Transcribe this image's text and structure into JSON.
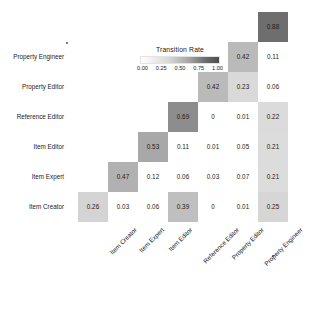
{
  "chart_data": {
    "type": "heatmap",
    "title": "",
    "legend_title": "Transition Rate",
    "legend_ticks": [
      "0.00",
      "0.25",
      "0.50",
      "0.75",
      "1.00"
    ],
    "legend_position": "inside-upper-left",
    "colorscale": "grayscale-white-to-dark",
    "zlim": [
      0,
      1
    ],
    "xlabel": "",
    "ylabel": "",
    "grid": false,
    "x_categories": [
      "Item Creator",
      "Item Expert",
      "Item Editor",
      "Reference Editor",
      "Property Editor",
      "Property Engineer"
    ],
    "y_categories": [
      "Property Engineer",
      "Property Editor",
      "Reference Editor",
      "Item Editor",
      "Item Expert",
      "Item Creator"
    ],
    "n_columns": 7,
    "n_rows": 7,
    "cells": [
      {
        "row": 0,
        "col": 6,
        "value": "0.88",
        "v": 0.88,
        "shaded": true
      },
      {
        "row": 1,
        "col": 5,
        "value": "0.42",
        "v": 0.42,
        "shaded": true
      },
      {
        "row": 1,
        "col": 6,
        "value": "0.11",
        "v": 0.11,
        "shaded": false
      },
      {
        "row": 2,
        "col": 4,
        "value": "0.42",
        "v": 0.42,
        "shaded": true
      },
      {
        "row": 2,
        "col": 5,
        "value": "0.23",
        "v": 0.23,
        "shaded": true
      },
      {
        "row": 2,
        "col": 6,
        "value": "0.06",
        "v": 0.06,
        "shaded": false
      },
      {
        "row": 3,
        "col": 3,
        "value": "0.69",
        "v": 0.69,
        "shaded": true
      },
      {
        "row": 3,
        "col": 4,
        "value": "0",
        "v": 0,
        "shaded": false
      },
      {
        "row": 3,
        "col": 5,
        "value": "0.01",
        "v": 0.01,
        "shaded": false
      },
      {
        "row": 3,
        "col": 6,
        "value": "0.22",
        "v": 0.22,
        "shaded": true
      },
      {
        "row": 4,
        "col": 2,
        "value": "0.53",
        "v": 0.53,
        "shaded": true
      },
      {
        "row": 4,
        "col": 3,
        "value": "0.11",
        "v": 0.11,
        "shaded": false
      },
      {
        "row": 4,
        "col": 4,
        "value": "0.01",
        "v": 0.01,
        "shaded": false
      },
      {
        "row": 4,
        "col": 5,
        "value": "0.05",
        "v": 0.05,
        "shaded": false
      },
      {
        "row": 4,
        "col": 6,
        "value": "0.21",
        "v": 0.21,
        "shaded": true
      },
      {
        "row": 5,
        "col": 1,
        "value": "0.47",
        "v": 0.47,
        "shaded": true
      },
      {
        "row": 5,
        "col": 2,
        "value": "0.12",
        "v": 0.12,
        "shaded": false
      },
      {
        "row": 5,
        "col": 3,
        "value": "0.06",
        "v": 0.06,
        "shaded": false
      },
      {
        "row": 5,
        "col": 4,
        "value": "0.03",
        "v": 0.03,
        "shaded": false
      },
      {
        "row": 5,
        "col": 5,
        "value": "0.07",
        "v": 0.07,
        "shaded": false
      },
      {
        "row": 5,
        "col": 6,
        "value": "0.21",
        "v": 0.21,
        "shaded": true
      },
      {
        "row": 6,
        "col": 0,
        "value": "0.26",
        "v": 0.26,
        "shaded": true
      },
      {
        "row": 6,
        "col": 1,
        "value": "0.03",
        "v": 0.03,
        "shaded": false
      },
      {
        "row": 6,
        "col": 2,
        "value": "0.06",
        "v": 0.06,
        "shaded": false
      },
      {
        "row": 6,
        "col": 3,
        "value": "0.39",
        "v": 0.39,
        "shaded": true
      },
      {
        "row": 6,
        "col": 4,
        "value": "0",
        "v": 0,
        "shaded": false
      },
      {
        "row": 6,
        "col": 5,
        "value": "0.01",
        "v": 0.01,
        "shaded": false
      },
      {
        "row": 6,
        "col": 6,
        "value": "0.25",
        "v": 0.25,
        "shaded": true
      }
    ]
  }
}
